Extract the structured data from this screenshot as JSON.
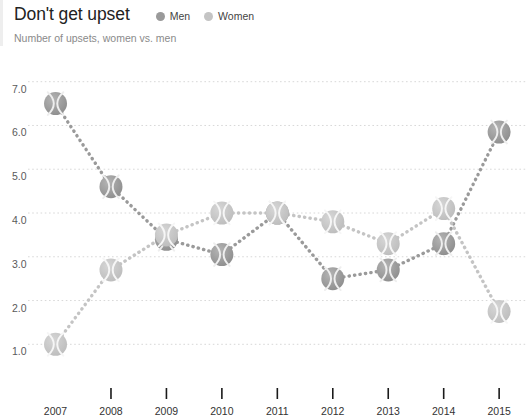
{
  "header": {
    "title": "Don't get upset",
    "subtitle": "Number of upsets, women vs. men"
  },
  "legend": [
    {
      "label": "Men",
      "color": "#9a9a9a",
      "icon": "legend-dot"
    },
    {
      "label": "Women",
      "color": "#c4c4c4",
      "icon": "legend-dot"
    }
  ],
  "axis": {
    "y_ticks": [
      "1.0",
      "2.0",
      "3.0",
      "4.0",
      "5.0",
      "6.0",
      "7.0"
    ],
    "x_ticks": [
      "2007",
      "2008",
      "2009",
      "2010",
      "2011",
      "2012",
      "2013",
      "2014",
      "2015"
    ]
  },
  "chart_data": {
    "type": "line",
    "title": "Don't get upset",
    "subtitle": "Number of upsets, women vs. men",
    "xlabel": "",
    "ylabel": "",
    "x": [
      2007,
      2008,
      2009,
      2010,
      2011,
      2012,
      2013,
      2014,
      2015
    ],
    "categories": [
      "2007",
      "2008",
      "2009",
      "2010",
      "2011",
      "2012",
      "2013",
      "2014",
      "2015"
    ],
    "series": [
      {
        "name": "Men",
        "color": "#9a9a9a",
        "marker": "tennis-ball",
        "linestyle": "dotted",
        "values": [
          6.5,
          4.6,
          3.4,
          3.05,
          4.0,
          2.5,
          2.7,
          3.3,
          5.85
        ]
      },
      {
        "name": "Women",
        "color": "#c4c4c4",
        "marker": "tennis-ball",
        "linestyle": "dotted",
        "values": [
          1.0,
          2.7,
          3.5,
          4.0,
          4.0,
          3.8,
          3.3,
          4.1,
          1.75
        ]
      }
    ],
    "ylim": [
      0.55,
      7.45
    ],
    "xlim": [
      2006.72,
      2015.25
    ],
    "yticks": [
      1.0,
      2.0,
      3.0,
      4.0,
      5.0,
      6.0,
      7.0
    ],
    "ytick_labels": [
      "1.0",
      "2.0",
      "3.0",
      "4.0",
      "5.0",
      "6.0",
      "7.0"
    ],
    "grid": "horizontal-dotted",
    "legend_position": "top-right-of-title"
  }
}
